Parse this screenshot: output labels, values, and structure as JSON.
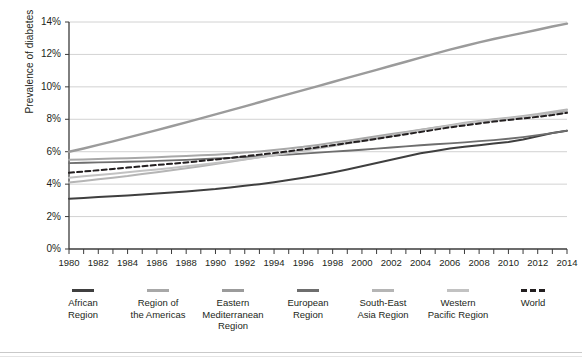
{
  "chart_data": {
    "type": "line",
    "title": "",
    "xlabel": "",
    "ylabel": "Prevalence of diabetes",
    "xlim": [
      1980,
      2014
    ],
    "ylim": [
      0,
      14
    ],
    "grid": true,
    "legend_position": "bottom",
    "y_ticks": [
      "0%",
      "2%",
      "4%",
      "6%",
      "8%",
      "10%",
      "12%",
      "14%"
    ],
    "y_tick_values": [
      0,
      2,
      4,
      6,
      8,
      10,
      12,
      14
    ],
    "x_ticks": [
      "1980",
      "1982",
      "1984",
      "1986",
      "1988",
      "1990",
      "1992",
      "1994",
      "1996",
      "1998",
      "2000",
      "2002",
      "2004",
      "2006",
      "2008",
      "2010",
      "2012",
      "2014"
    ],
    "x_tick_values": [
      1980,
      1982,
      1984,
      1986,
      1988,
      1990,
      1992,
      1994,
      1996,
      1998,
      2000,
      2002,
      2004,
      2006,
      2008,
      2010,
      2012,
      2014
    ],
    "x": [
      1980,
      1981,
      1982,
      1983,
      1984,
      1985,
      1986,
      1987,
      1988,
      1989,
      1990,
      1991,
      1992,
      1993,
      1994,
      1995,
      1996,
      1997,
      1998,
      1999,
      2000,
      2001,
      2002,
      2003,
      2004,
      2005,
      2006,
      2007,
      2008,
      2009,
      2010,
      2011,
      2012,
      2013,
      2014
    ],
    "series": [
      {
        "name": "African Region",
        "color": "#3f3f3f",
        "style": "solid",
        "width": 2.0,
        "values": [
          3.1,
          3.15,
          3.2,
          3.25,
          3.3,
          3.36,
          3.42,
          3.48,
          3.55,
          3.62,
          3.7,
          3.8,
          3.9,
          4.0,
          4.12,
          4.25,
          4.4,
          4.55,
          4.72,
          4.9,
          5.1,
          5.3,
          5.5,
          5.7,
          5.9,
          6.05,
          6.2,
          6.3,
          6.4,
          6.5,
          6.6,
          6.75,
          6.95,
          7.15,
          7.3
        ]
      },
      {
        "name": "Region of the Americas",
        "color": "#a8a8a8",
        "style": "solid",
        "width": 2.0,
        "values": [
          5.5,
          5.52,
          5.55,
          5.58,
          5.6,
          5.63,
          5.66,
          5.7,
          5.74,
          5.78,
          5.82,
          5.88,
          5.95,
          6.02,
          6.1,
          6.2,
          6.3,
          6.42,
          6.55,
          6.68,
          6.82,
          6.96,
          7.1,
          7.22,
          7.35,
          7.48,
          7.6,
          7.72,
          7.84,
          7.95,
          8.05,
          8.16,
          8.28,
          8.4,
          8.5
        ]
      },
      {
        "name": "Eastern Mediterranean Region",
        "color": "#9b9b9b",
        "style": "solid",
        "width": 2.4,
        "values": [
          6.0,
          6.2,
          6.42,
          6.64,
          6.87,
          7.1,
          7.33,
          7.57,
          7.81,
          8.06,
          8.3,
          8.55,
          8.8,
          9.05,
          9.3,
          9.55,
          9.8,
          10.05,
          10.3,
          10.55,
          10.8,
          11.05,
          11.3,
          11.55,
          11.8,
          12.05,
          12.3,
          12.52,
          12.74,
          12.95,
          13.14,
          13.33,
          13.52,
          13.72,
          13.9
        ]
      },
      {
        "name": "European Region",
        "color": "#6e6e6e",
        "style": "solid",
        "width": 1.8,
        "values": [
          5.3,
          5.32,
          5.34,
          5.36,
          5.38,
          5.4,
          5.43,
          5.46,
          5.5,
          5.54,
          5.58,
          5.62,
          5.67,
          5.72,
          5.77,
          5.82,
          5.88,
          5.94,
          6.0,
          6.06,
          6.12,
          6.19,
          6.26,
          6.33,
          6.4,
          6.46,
          6.52,
          6.58,
          6.65,
          6.72,
          6.8,
          6.9,
          7.02,
          7.15,
          7.3
        ]
      },
      {
        "name": "South-East Asia Region",
        "color": "#b5b5b5",
        "style": "solid",
        "width": 2.0,
        "values": [
          4.1,
          4.2,
          4.3,
          4.4,
          4.5,
          4.62,
          4.74,
          4.86,
          4.98,
          5.1,
          5.24,
          5.38,
          5.52,
          5.66,
          5.8,
          5.95,
          6.1,
          6.25,
          6.4,
          6.55,
          6.7,
          6.86,
          7.02,
          7.18,
          7.34,
          7.5,
          7.64,
          7.78,
          7.9,
          8.0,
          8.1,
          8.2,
          8.32,
          8.46,
          8.6
        ]
      },
      {
        "name": "Western Pacific Region",
        "color": "#c2c2c2",
        "style": "solid",
        "width": 2.0,
        "values": [
          4.4,
          4.48,
          4.56,
          4.64,
          4.73,
          4.82,
          4.91,
          5.0,
          5.1,
          5.2,
          5.3,
          5.42,
          5.54,
          5.66,
          5.78,
          5.92,
          6.06,
          6.2,
          6.35,
          6.5,
          6.65,
          6.8,
          6.96,
          7.12,
          7.28,
          7.44,
          7.58,
          7.72,
          7.85,
          7.96,
          8.05,
          8.14,
          8.23,
          8.32,
          8.4
        ]
      },
      {
        "name": "World",
        "color": "#231f20",
        "style": "dashed",
        "width": 2.0,
        "values": [
          4.7,
          4.78,
          4.86,
          4.94,
          5.02,
          5.1,
          5.18,
          5.26,
          5.34,
          5.43,
          5.52,
          5.62,
          5.72,
          5.82,
          5.92,
          6.03,
          6.15,
          6.27,
          6.4,
          6.53,
          6.66,
          6.8,
          6.94,
          7.08,
          7.22,
          7.36,
          7.5,
          7.62,
          7.74,
          7.86,
          7.96,
          8.05,
          8.15,
          8.26,
          8.4
        ]
      }
    ]
  },
  "legend": {
    "items": [
      {
        "label_line1": "African",
        "label_line2": "Region",
        "label_line3": ""
      },
      {
        "label_line1": "Region of",
        "label_line2": "the Americas",
        "label_line3": ""
      },
      {
        "label_line1": "Eastern",
        "label_line2": "Mediterranean",
        "label_line3": "Region"
      },
      {
        "label_line1": "European",
        "label_line2": "Region",
        "label_line3": ""
      },
      {
        "label_line1": "South-East",
        "label_line2": "Asia Region",
        "label_line3": ""
      },
      {
        "label_line1": "Western",
        "label_line2": "Pacific Region",
        "label_line3": ""
      },
      {
        "label_line1": "World",
        "label_line2": "",
        "label_line3": ""
      }
    ]
  }
}
